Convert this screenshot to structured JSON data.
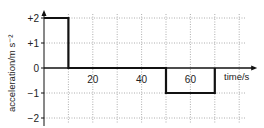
{
  "chart_data": {
    "type": "line",
    "title": "",
    "xlabel": "time/s",
    "ylabel": "acceleration/m s⁻²",
    "x_ticks": [
      20,
      40,
      60
    ],
    "x_tick_labels": [
      "20",
      "40",
      "60"
    ],
    "y_ticks": [
      2,
      1,
      0,
      -1,
      -2
    ],
    "y_tick_labels": [
      "+2",
      "+1",
      "0",
      "−1",
      "−2"
    ],
    "xlim": [
      0,
      80
    ],
    "ylim": [
      -2,
      2
    ],
    "grid": true,
    "grid_style": "dotted",
    "grid_x_step": 10,
    "legend": null,
    "series": [
      {
        "name": "acceleration",
        "x": [
          0,
          10,
          10,
          50,
          50,
          70,
          70
        ],
        "y": [
          2,
          2,
          0,
          0,
          -1,
          -1,
          0
        ],
        "color": "#111111"
      }
    ]
  }
}
